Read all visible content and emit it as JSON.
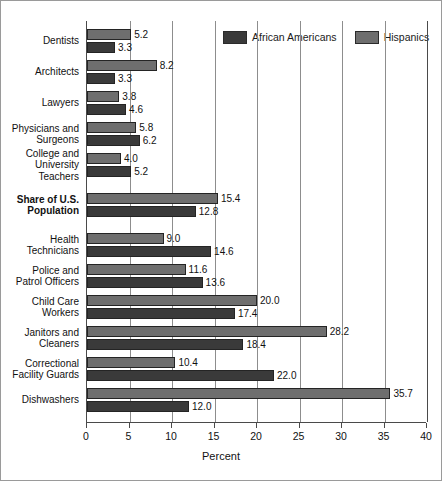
{
  "chart_data": {
    "type": "bar",
    "orientation": "horizontal",
    "title": "",
    "xlabel": "Percent",
    "ylabel": "",
    "xlim": [
      0,
      40
    ],
    "xticks": [
      0,
      5,
      10,
      15,
      20,
      25,
      30,
      35,
      40
    ],
    "grid": true,
    "legend_position": "top-right",
    "categories": [
      "Dentists",
      "Architects",
      "Lawyers",
      "Physicians and Surgeons",
      "College and University Teachers",
      "Share of U.S. Population",
      "Health Technicians",
      "Police and Patrol Officers",
      "Child Care Workers",
      "Janitors and Cleaners",
      "Correctional Facility Guards",
      "Dishwashers"
    ],
    "series": [
      {
        "name": "Hispanics",
        "color": "#6e6e6e",
        "values": [
          5.2,
          8.2,
          3.8,
          5.8,
          4.0,
          15.4,
          9.0,
          11.6,
          20.0,
          28.2,
          10.4,
          35.7
        ]
      },
      {
        "name": "African Americans",
        "color": "#3a3a3a",
        "values": [
          3.3,
          3.3,
          4.6,
          6.2,
          5.2,
          12.8,
          14.6,
          13.6,
          17.4,
          18.4,
          22.0,
          12.0
        ]
      }
    ],
    "highlighted_category": "Share of U.S. Population"
  },
  "legend": {
    "entries": [
      {
        "label": "African Americans",
        "key": "aa"
      },
      {
        "label": "Hispanics",
        "key": "hi"
      }
    ]
  },
  "axis": {
    "x_title": "Percent"
  }
}
